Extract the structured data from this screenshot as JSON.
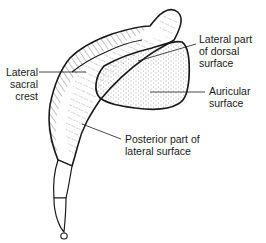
{
  "diagram": {
    "colors": {
      "outline": "#1a1a1a",
      "hatch": "#333333",
      "stipple": "#444444",
      "background": "#ffffff"
    },
    "labels": [
      {
        "id": "lateral-sacral-crest",
        "lines": [
          "Lateral",
          "sacral",
          "crest"
        ]
      },
      {
        "id": "lateral-part-dorsal-surface",
        "lines": [
          "Lateral part",
          "of dorsal",
          "surface"
        ]
      },
      {
        "id": "auricular-surface",
        "lines": [
          "Auricular",
          "surface"
        ]
      },
      {
        "id": "posterior-part-lateral-surface",
        "lines": [
          "Posterior part of",
          "lateral surface"
        ]
      }
    ]
  }
}
